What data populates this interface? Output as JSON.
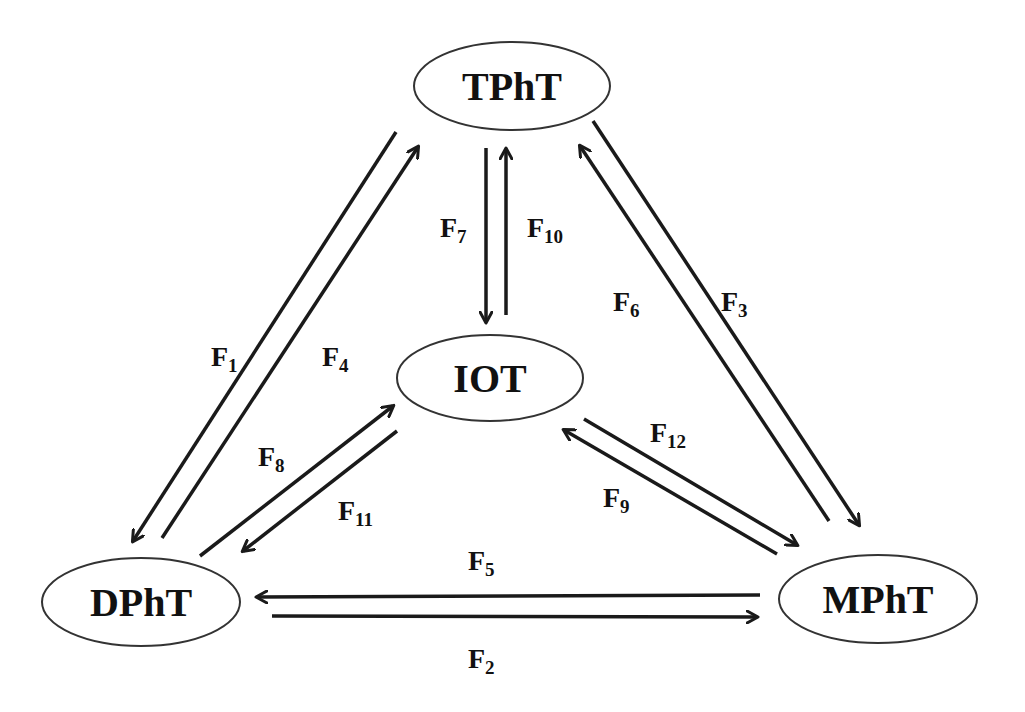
{
  "nodes": [
    {
      "id": "TPhT",
      "label": "TPhT",
      "cx": 512,
      "cy": 86,
      "rx": 98,
      "ry": 44
    },
    {
      "id": "IOT",
      "label": "IOT",
      "cx": 490,
      "cy": 378,
      "rx": 93,
      "ry": 43
    },
    {
      "id": "DPhT",
      "label": "DPhT",
      "cx": 141,
      "cy": 602,
      "rx": 99,
      "ry": 44
    },
    {
      "id": "MPhT",
      "label": "MPhT",
      "cx": 878,
      "cy": 599,
      "rx": 99,
      "ry": 44
    }
  ],
  "edges": [
    {
      "id": "F1",
      "label": "F",
      "sub": "1",
      "from": "TPhT",
      "to": "DPhT",
      "x1": 396,
      "y1": 132,
      "x2": 133,
      "y2": 541,
      "lx": 211,
      "ly": 366
    },
    {
      "id": "F4",
      "label": "F",
      "sub": "4",
      "from": "DPhT",
      "to": "TPhT",
      "x1": 162,
      "y1": 538,
      "x2": 418,
      "y2": 147,
      "lx": 322,
      "ly": 366
    },
    {
      "id": "F3",
      "label": "F",
      "sub": "3",
      "from": "TPhT",
      "to": "MPhT",
      "x1": 593,
      "y1": 121,
      "x2": 859,
      "y2": 525,
      "lx": 721,
      "ly": 311
    },
    {
      "id": "F6",
      "label": "F",
      "sub": "6",
      "from": "MPhT",
      "to": "TPhT",
      "x1": 829,
      "y1": 521,
      "x2": 580,
      "y2": 146,
      "lx": 613,
      "ly": 311
    },
    {
      "id": "F7",
      "label": "F",
      "sub": "7",
      "from": "TPhT",
      "to": "IOT",
      "x1": 486,
      "y1": 148,
      "x2": 486,
      "y2": 322,
      "lx": 440,
      "ly": 237
    },
    {
      "id": "F10",
      "label": "F",
      "sub": "10",
      "from": "IOT",
      "to": "TPhT",
      "x1": 506,
      "y1": 315,
      "x2": 506,
      "y2": 149,
      "lx": 527,
      "ly": 237
    },
    {
      "id": "F8",
      "label": "F",
      "sub": "8",
      "from": "DPhT",
      "to": "IOT",
      "x1": 200,
      "y1": 556,
      "x2": 393,
      "y2": 406,
      "lx": 258,
      "ly": 466
    },
    {
      "id": "F11",
      "label": "F",
      "sub": "11",
      "from": "IOT",
      "to": "DPhT",
      "x1": 397,
      "y1": 431,
      "x2": 243,
      "y2": 551,
      "lx": 338,
      "ly": 520
    },
    {
      "id": "F12",
      "label": "F",
      "sub": "12",
      "from": "IOT",
      "to": "MPhT",
      "x1": 584,
      "y1": 419,
      "x2": 797,
      "y2": 545,
      "lx": 650,
      "ly": 442
    },
    {
      "id": "F9",
      "label": "F",
      "sub": "9",
      "from": "MPhT",
      "to": "IOT",
      "x1": 777,
      "y1": 554,
      "x2": 564,
      "y2": 430,
      "lx": 603,
      "ly": 507
    },
    {
      "id": "F5",
      "label": "F",
      "sub": "5",
      "from": "MPhT",
      "to": "DPhT",
      "x1": 760,
      "y1": 595,
      "x2": 257,
      "y2": 597,
      "lx": 468,
      "ly": 570
    },
    {
      "id": "F2",
      "label": "F",
      "sub": "2",
      "from": "DPhT",
      "to": "MPhT",
      "x1": 272,
      "y1": 616,
      "x2": 757,
      "y2": 617,
      "lx": 468,
      "ly": 668
    }
  ],
  "colors": {
    "stroke": "#1a1a1a",
    "node_border": "#333333",
    "background": "#ffffff"
  }
}
